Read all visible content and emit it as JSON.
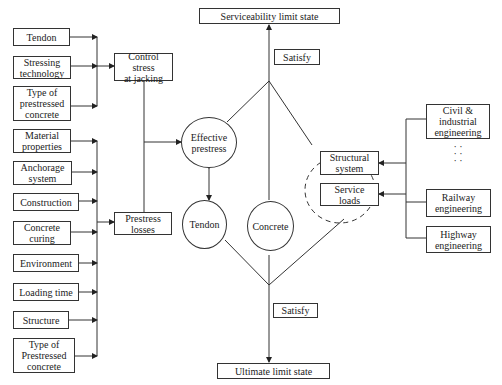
{
  "left_factors_jacking": [
    {
      "label": "Tendon"
    },
    {
      "label": "Stressing\ntechnology"
    },
    {
      "label": "Type of\nprestressed\nconcrete"
    }
  ],
  "left_factors_losses": [
    {
      "label": "Material\nproperties"
    },
    {
      "label": "Anchorage\nsystem"
    },
    {
      "label": "Construction"
    },
    {
      "label": "Concrete\ncuring"
    },
    {
      "label": "Environment"
    },
    {
      "label": "Loading time"
    },
    {
      "label": "Structure"
    },
    {
      "label": "Type of\nPrestressed\nconcrete"
    }
  ],
  "middle": {
    "control_stress": "Control stress\nat jacking",
    "prestress_losses": "Prestress\nlosses"
  },
  "nodes": {
    "effective_prestress": "Effective\nprestress",
    "tendon": "Tendon",
    "concrete": "Concrete"
  },
  "limit_states": {
    "serviceability": "Serviceability limit state",
    "ultimate": "Ultimate limit state",
    "satisfy_top": "Satisfy",
    "satisfy_bottom": "Satisfy"
  },
  "group": {
    "structural_system": "Structural\nsystem",
    "service_loads": "Service\nloads"
  },
  "right_factors": [
    {
      "label": "Civil &\nindustrial\nengineering"
    },
    {
      "label": "Railway\nengineering"
    },
    {
      "label": "Highway\nengineering"
    }
  ],
  "ellipsis": "·\n·\n·\n·\n·\n·"
}
